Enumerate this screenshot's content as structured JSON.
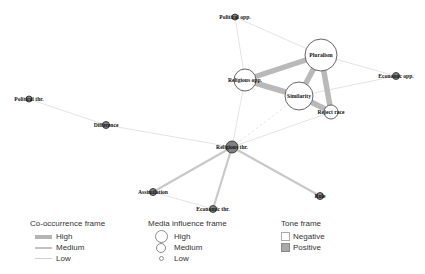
{
  "figure": {
    "type": "network-diagram",
    "background": "#ffffff"
  },
  "colors": {
    "edge_high": "#b9b9b9",
    "edge_medium": "#c9c9c9",
    "edge_low": "#dcdcdc",
    "node_positive_fill": "#808080",
    "node_positive_stroke": "#333333",
    "node_negative_fill": "#ffffff",
    "node_negative_stroke": "#555555",
    "label_color": "#111111"
  },
  "network": {
    "nodes": [
      {
        "id": "political_opp",
        "label": "Political opp.",
        "x": 235,
        "y": 17,
        "r": 3,
        "influence": "low",
        "tone": "positive"
      },
      {
        "id": "pluralism",
        "label": "Pluralism",
        "x": 321,
        "y": 55,
        "r": 16,
        "influence": "high",
        "tone": "negative"
      },
      {
        "id": "religious_opp",
        "label": "Religious opp.",
        "x": 245,
        "y": 80,
        "r": 11,
        "influence": "medium",
        "tone": "negative"
      },
      {
        "id": "economic_opp",
        "label": "Economic opp.",
        "x": 396,
        "y": 76,
        "r": 3.5,
        "influence": "low",
        "tone": "positive"
      },
      {
        "id": "similarity",
        "label": "Similarity",
        "x": 299,
        "y": 96,
        "r": 14,
        "influence": "high",
        "tone": "negative"
      },
      {
        "id": "reject_race",
        "label": "Reject race",
        "x": 331,
        "y": 112,
        "r": 7,
        "influence": "medium",
        "tone": "negative"
      },
      {
        "id": "political_thr",
        "label": "Political thr.",
        "x": 29,
        "y": 99,
        "r": 3,
        "influence": "low",
        "tone": "positive"
      },
      {
        "id": "difference",
        "label": "Difference",
        "x": 106,
        "y": 125,
        "r": 3.5,
        "influence": "low",
        "tone": "positive"
      },
      {
        "id": "religious_thr",
        "label": "Religious thr.",
        "x": 232,
        "y": 147,
        "r": 6,
        "influence": "medium",
        "tone": "positive"
      },
      {
        "id": "assimilation",
        "label": "Assimilation",
        "x": 153,
        "y": 192,
        "r": 3.5,
        "influence": "low",
        "tone": "positive"
      },
      {
        "id": "economic_thr",
        "label": "Economic thr.",
        "x": 213,
        "y": 209,
        "r": 3.5,
        "influence": "low",
        "tone": "positive"
      },
      {
        "id": "rule",
        "label": "Rule",
        "x": 320,
        "y": 196,
        "r": 3.5,
        "influence": "low",
        "tone": "positive"
      }
    ],
    "edges": [
      {
        "source": "religious_opp",
        "target": "pluralism",
        "weight": "high",
        "dashed": false
      },
      {
        "source": "religious_opp",
        "target": "similarity",
        "weight": "high",
        "dashed": false
      },
      {
        "source": "pluralism",
        "target": "similarity",
        "weight": "high",
        "dashed": false
      },
      {
        "source": "pluralism",
        "target": "reject_race",
        "weight": "high",
        "dashed": false
      },
      {
        "source": "similarity",
        "target": "reject_race",
        "weight": "high",
        "dashed": false
      },
      {
        "source": "political_opp",
        "target": "religious_opp",
        "weight": "low",
        "dashed": false
      },
      {
        "source": "political_opp",
        "target": "pluralism",
        "weight": "low",
        "dashed": false
      },
      {
        "source": "pluralism",
        "target": "economic_opp",
        "weight": "low",
        "dashed": false
      },
      {
        "source": "similarity",
        "target": "economic_opp",
        "weight": "low",
        "dashed": false
      },
      {
        "source": "political_thr",
        "target": "difference",
        "weight": "low",
        "dashed": false
      },
      {
        "source": "difference",
        "target": "religious_thr",
        "weight": "low",
        "dashed": false
      },
      {
        "source": "religious_opp",
        "target": "religious_thr",
        "weight": "low",
        "dashed": false
      },
      {
        "source": "religious_thr",
        "target": "similarity",
        "weight": "low",
        "dashed": true
      },
      {
        "source": "religious_thr",
        "target": "reject_race",
        "weight": "low",
        "dashed": false
      },
      {
        "source": "religious_thr",
        "target": "assimilation",
        "weight": "medium",
        "dashed": false
      },
      {
        "source": "religious_thr",
        "target": "economic_thr",
        "weight": "medium",
        "dashed": false
      },
      {
        "source": "religious_thr",
        "target": "rule",
        "weight": "medium",
        "dashed": false
      },
      {
        "source": "assimilation",
        "target": "economic_thr",
        "weight": "low",
        "dashed": false
      }
    ]
  },
  "legend": {
    "cooccurrence": {
      "title": "Co-occurrence frame",
      "items": [
        {
          "label": "High",
          "weight": "high"
        },
        {
          "label": "Medium",
          "weight": "medium"
        },
        {
          "label": "Low",
          "weight": "low"
        }
      ]
    },
    "media_influence": {
      "title": "Media influence frame",
      "items": [
        {
          "label": "High",
          "size": "high"
        },
        {
          "label": "Medium",
          "size": "medium"
        },
        {
          "label": "Low",
          "size": "low"
        }
      ]
    },
    "tone": {
      "title": "Tone frame",
      "items": [
        {
          "label": "Negative",
          "tone": "negative"
        },
        {
          "label": "Positive",
          "tone": "positive"
        }
      ]
    }
  }
}
